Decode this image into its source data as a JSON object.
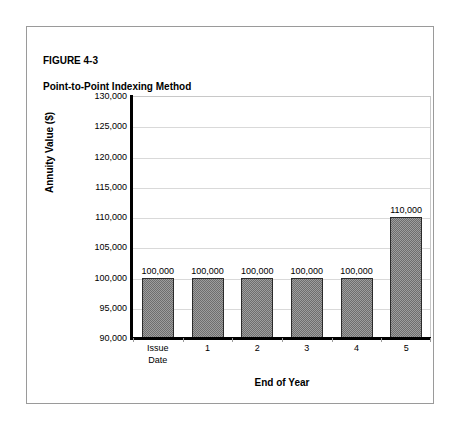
{
  "figure": {
    "label": "FIGURE 4-3",
    "title": "Point-to-Point Indexing Method"
  },
  "chart_data": {
    "type": "bar",
    "title": "Point-to-Point Indexing Method",
    "categories": [
      "Issue Date",
      "1",
      "2",
      "3",
      "4",
      "5"
    ],
    "values": [
      100000,
      100000,
      100000,
      100000,
      100000,
      110000
    ],
    "data_labels": [
      "100,000",
      "100,000",
      "100,000",
      "100,000",
      "100,000",
      "110,000"
    ],
    "xlabel": "End of Year",
    "ylabel": "Annuity Value ($)",
    "ylim": [
      90000,
      130000
    ],
    "ytick_values": [
      90000,
      95000,
      100000,
      105000,
      110000,
      115000,
      120000,
      125000,
      130000
    ],
    "ytick_labels": [
      "90,000",
      "95,000",
      "100,000",
      "105,000",
      "110,000",
      "115,000",
      "120,000",
      "125,000",
      "130,000"
    ],
    "grid": true,
    "legend": false,
    "bar_color": "#6e6e6e",
    "bar_border_color": "#2b2b2b",
    "gridline_color": "#d9d9d9",
    "axis_color": "#000000"
  }
}
